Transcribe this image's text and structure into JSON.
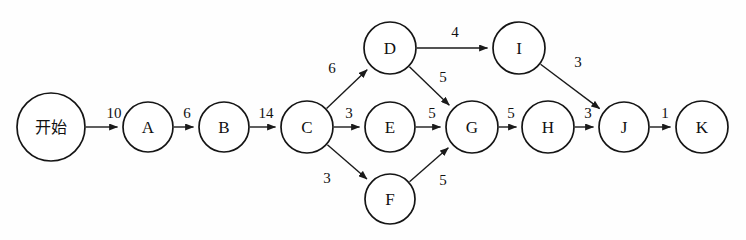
{
  "diagram": {
    "type": "activity-network",
    "title": "",
    "width": 746,
    "height": 240,
    "background_color": "#fefefe",
    "stroke_color": "#151515",
    "text_color": "#111111"
  },
  "nodes": [
    {
      "id": "start",
      "label": "开始",
      "cx": 51,
      "cy": 127,
      "r": 34,
      "cjk": true
    },
    {
      "id": "A",
      "label": "A",
      "cx": 148,
      "cy": 127,
      "r": 25,
      "cjk": false
    },
    {
      "id": "B",
      "label": "B",
      "cx": 224,
      "cy": 127,
      "r": 25,
      "cjk": false
    },
    {
      "id": "C",
      "label": "C",
      "cx": 307,
      "cy": 127,
      "r": 26,
      "cjk": false
    },
    {
      "id": "D",
      "label": "D",
      "cx": 390,
      "cy": 48,
      "r": 26,
      "cjk": false
    },
    {
      "id": "E",
      "label": "E",
      "cx": 390,
      "cy": 127,
      "r": 25,
      "cjk": false
    },
    {
      "id": "F",
      "label": "F",
      "cx": 390,
      "cy": 199,
      "r": 25,
      "cjk": false
    },
    {
      "id": "G",
      "label": "G",
      "cx": 472,
      "cy": 127,
      "r": 26,
      "cjk": false
    },
    {
      "id": "H",
      "label": "H",
      "cx": 548,
      "cy": 127,
      "r": 26,
      "cjk": false
    },
    {
      "id": "I",
      "label": "I",
      "cx": 519,
      "cy": 48,
      "r": 26,
      "cjk": false
    },
    {
      "id": "J",
      "label": "J",
      "cx": 624,
      "cy": 127,
      "r": 25,
      "cjk": false
    },
    {
      "id": "K",
      "label": "K",
      "cx": 702,
      "cy": 127,
      "r": 26,
      "cjk": false
    }
  ],
  "edges": [
    {
      "id": "start-A",
      "from": "start",
      "to": "A",
      "weight": "10",
      "lx": 114,
      "ly": 113
    },
    {
      "id": "A-B",
      "from": "A",
      "to": "B",
      "weight": "6",
      "lx": 187,
      "ly": 113
    },
    {
      "id": "B-C",
      "from": "B",
      "to": "C",
      "weight": "14",
      "lx": 266,
      "ly": 113
    },
    {
      "id": "C-D",
      "from": "C",
      "to": "D",
      "weight": "6",
      "lx": 332,
      "ly": 68
    },
    {
      "id": "C-E",
      "from": "C",
      "to": "E",
      "weight": "3",
      "lx": 349,
      "ly": 113
    },
    {
      "id": "C-F",
      "from": "C",
      "to": "F",
      "weight": "3",
      "lx": 327,
      "ly": 178
    },
    {
      "id": "D-I",
      "from": "D",
      "to": "I",
      "weight": "4",
      "lx": 455,
      "ly": 32
    },
    {
      "id": "D-G",
      "from": "D",
      "to": "G",
      "weight": "5",
      "lx": 443,
      "ly": 77
    },
    {
      "id": "E-G",
      "from": "E",
      "to": "G",
      "weight": "5",
      "lx": 432,
      "ly": 113
    },
    {
      "id": "F-G",
      "from": "F",
      "to": "G",
      "weight": "5",
      "lx": 443,
      "ly": 180
    },
    {
      "id": "G-H",
      "from": "G",
      "to": "H",
      "weight": "5",
      "lx": 511,
      "ly": 113
    },
    {
      "id": "I-J",
      "from": "I",
      "to": "J",
      "weight": "3",
      "lx": 578,
      "ly": 62
    },
    {
      "id": "H-J",
      "from": "H",
      "to": "J",
      "weight": "3",
      "lx": 588,
      "ly": 113
    },
    {
      "id": "J-K",
      "from": "J",
      "to": "K",
      "weight": "1",
      "lx": 665,
      "ly": 113
    }
  ]
}
